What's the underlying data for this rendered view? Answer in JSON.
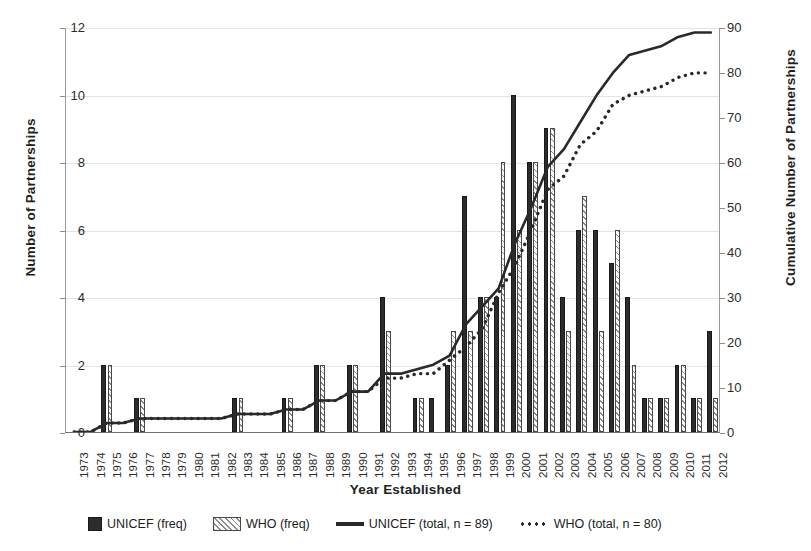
{
  "chart_data": {
    "type": "bar",
    "title": "",
    "xlabel": "Year Established",
    "ylabel": "Number of Partnerships",
    "y2label": "Cumulative Number of Partnerships",
    "ylim": [
      0,
      12
    ],
    "y2lim": [
      0,
      90
    ],
    "yticks": [
      0,
      2,
      4,
      6,
      8,
      10,
      12
    ],
    "y2ticks": [
      0,
      10,
      20,
      30,
      40,
      50,
      60,
      70,
      80,
      90
    ],
    "grid": true,
    "legend_position": "bottom",
    "categories": [
      "1973",
      "1974",
      "1975",
      "1976",
      "1977",
      "1978",
      "1979",
      "1980",
      "1981",
      "1982",
      "1983",
      "1984",
      "1985",
      "1986",
      "1987",
      "1988",
      "1989",
      "1990",
      "1991",
      "1992",
      "1993",
      "1994",
      "1995",
      "1996",
      "1997",
      "1998",
      "1999",
      "2000",
      "2001",
      "2002",
      "2003",
      "2004",
      "2005",
      "2006",
      "2007",
      "2008",
      "2009",
      "2010",
      "2011",
      "2012"
    ],
    "series": [
      {
        "name": "UNICEF (freq)",
        "kind": "bar",
        "axis": "left",
        "values": [
          0,
          0,
          2,
          0,
          1,
          0,
          0,
          0,
          0,
          0,
          1,
          0,
          0,
          1,
          0,
          2,
          0,
          2,
          0,
          4,
          0,
          1,
          1,
          2,
          7,
          4,
          4,
          10,
          8,
          9,
          4,
          6,
          6,
          5,
          4,
          1,
          1,
          2,
          1,
          3
        ]
      },
      {
        "name": "WHO (freq)",
        "kind": "bar",
        "axis": "left",
        "values": [
          0,
          0,
          2,
          0,
          1,
          0,
          0,
          0,
          0,
          0,
          1,
          0,
          0,
          1,
          0,
          2,
          0,
          2,
          0,
          3,
          0,
          1,
          0,
          3,
          3,
          4,
          8,
          6,
          8,
          9,
          3,
          7,
          3,
          6,
          2,
          1,
          1,
          2,
          1,
          1
        ]
      },
      {
        "name": "UNICEF (total, n = 89)",
        "kind": "line",
        "style": "solid",
        "axis": "right",
        "values": [
          0,
          0,
          2,
          2,
          3,
          3,
          3,
          3,
          3,
          3,
          4,
          4,
          4,
          5,
          5,
          7,
          7,
          9,
          9,
          13,
          13,
          14,
          15,
          17,
          24,
          28,
          32,
          42,
          50,
          59,
          63,
          69,
          75,
          80,
          84,
          85,
          86,
          88,
          89,
          89
        ]
      },
      {
        "name": "WHO (total, n = 80)",
        "kind": "line",
        "style": "dotted",
        "axis": "right",
        "values": [
          0,
          0,
          2,
          2,
          3,
          3,
          3,
          3,
          3,
          3,
          4,
          4,
          4,
          5,
          5,
          7,
          7,
          9,
          9,
          12,
          12,
          13,
          13,
          16,
          19,
          23,
          31,
          37,
          45,
          54,
          57,
          64,
          67,
          73,
          75,
          76,
          77,
          79,
          80,
          80
        ]
      }
    ],
    "colors": {
      "unicef_bar": "#2e2b2b",
      "who_bar": "#fbfbfb",
      "who_hatch": "#8d8a8a",
      "line": "#2b2828",
      "grid": "#e3e3e3",
      "axis": "#9a9a9a"
    }
  },
  "legend": {
    "items": [
      {
        "label": "UNICEF (freq)",
        "swatch": "unicef-bar-swatch"
      },
      {
        "label": "WHO (freq)",
        "swatch": "who-bar-swatch"
      },
      {
        "label": "UNICEF (total, n = 89)",
        "swatch": "unicef-line-swatch"
      },
      {
        "label": "WHO (total, n = 80)",
        "swatch": "who-line-swatch"
      }
    ]
  }
}
